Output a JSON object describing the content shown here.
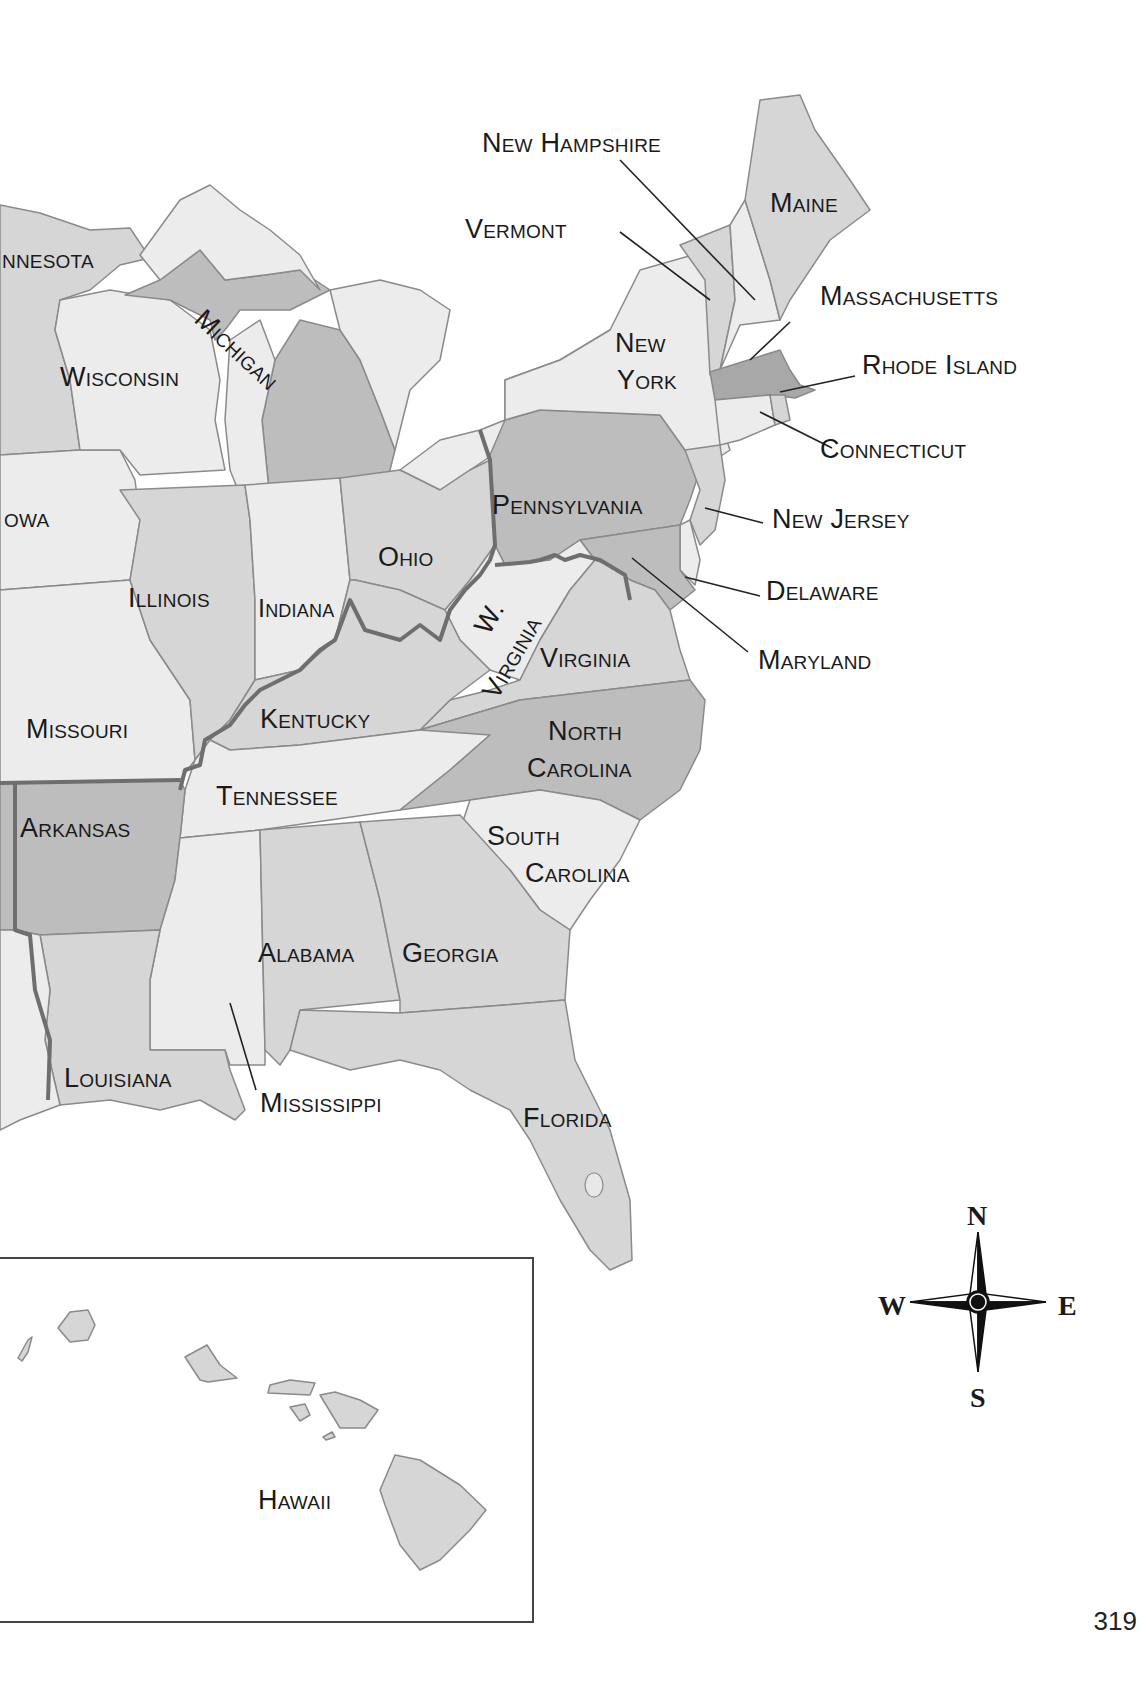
{
  "map": {
    "title": "",
    "page_number": "319",
    "colors": {
      "light": "#ececec",
      "mid": "#d6d6d6",
      "dark": "#bdbdbd",
      "darker": "#a8a8a8",
      "border_highlight": "#6e6e6e",
      "label": "#1a1a1a"
    },
    "labels": {
      "minnesota": "nnesota",
      "wisconsin": "Wisconsin",
      "michigan": "Michigan",
      "iowa": "owa",
      "illinois": "Illinois",
      "indiana": "Indiana",
      "ohio": "Ohio",
      "missouri": "Missouri",
      "kentucky": "Kentucky",
      "tennessee": "Tennessee",
      "arkansas": "Arkansas",
      "louisiana": "Louisiana",
      "mississippi": "Mississippi",
      "alabama": "Alabama",
      "georgia": "Georgia",
      "florida": "Florida",
      "south_carolina_1": "South",
      "south_carolina_2": "Carolina",
      "north_carolina_1": "North",
      "north_carolina_2": "Carolina",
      "virginia": "Virginia",
      "west_virginia_1": "W.",
      "west_virginia_2": "Virginia",
      "pennsylvania": "Pennsylvania",
      "new_york_1": "New",
      "new_york_2": "York",
      "maine": "Maine",
      "new_hampshire": "New Hampshire",
      "vermont": "Vermont",
      "massachusetts": "Massachusetts",
      "rhode_island": "Rhode Island",
      "connecticut": "Connecticut",
      "new_jersey": "New Jersey",
      "delaware": "Delaware",
      "maryland": "Maryland",
      "hawaii": "Hawaii"
    },
    "compass": {
      "north": "N",
      "south": "S",
      "east": "E",
      "west": "W"
    }
  }
}
